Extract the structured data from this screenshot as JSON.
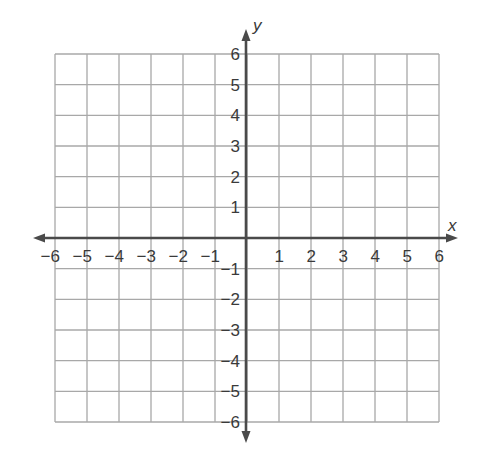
{
  "chart_data": {
    "type": "scatter",
    "title": "",
    "xlabel": "x",
    "ylabel": "y",
    "xlim": [
      -6,
      6
    ],
    "ylim": [
      -6,
      6
    ],
    "grid": true,
    "x_ticks": [
      -6,
      -5,
      -4,
      -3,
      -2,
      -1,
      1,
      2,
      3,
      4,
      5,
      6
    ],
    "y_ticks": [
      -6,
      -5,
      -4,
      -3,
      -2,
      -1,
      1,
      2,
      3,
      4,
      5,
      6
    ],
    "x_tick_labels": [
      "−6",
      "−5",
      "−4",
      "−3",
      "−2",
      "−1",
      "1",
      "2",
      "3",
      "4",
      "5",
      "6"
    ],
    "y_tick_labels": [
      "−6",
      "−5",
      "−4",
      "−3",
      "−2",
      "−1",
      "1",
      "2",
      "3",
      "4",
      "5",
      "6"
    ],
    "series": [],
    "legend": null
  },
  "colors": {
    "grid": "#a8a8a8",
    "axis": "#4a4a4a",
    "text": "#3a3a3a",
    "background": "#ffffff"
  }
}
